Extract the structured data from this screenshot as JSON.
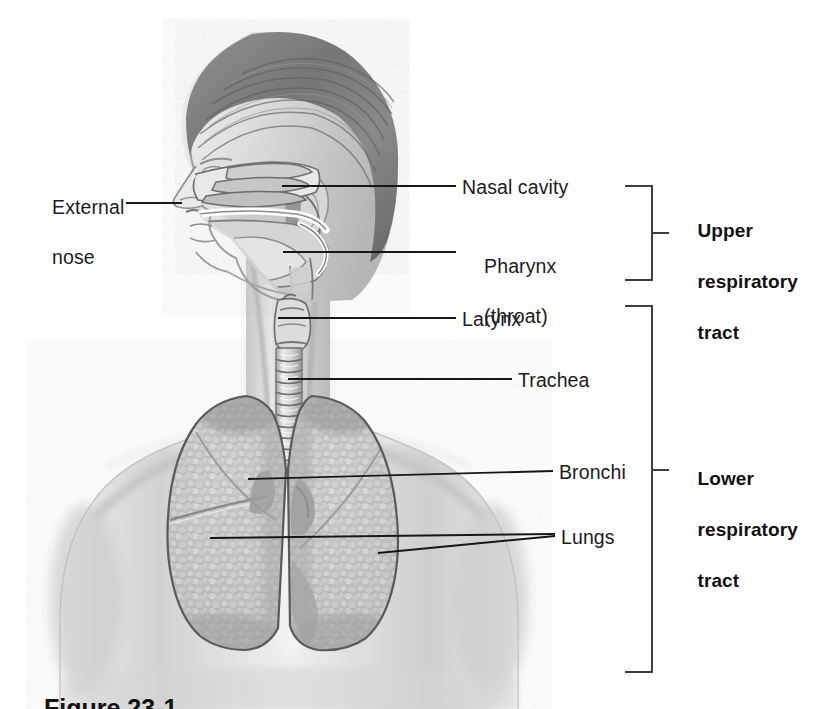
{
  "figure": {
    "background_color": "#ffffff",
    "line_color": "#14181c",
    "bracket_color": "#3b3f44",
    "text_color": "#1c1c1c",
    "width": 822,
    "height": 709
  },
  "labels": {
    "external_nose_line1": "External",
    "external_nose_line2": "nose",
    "nasal_cavity": "Nasal cavity",
    "pharynx_line1": "Pharynx",
    "pharynx_line2": "(throat)",
    "larynx": "Larynx",
    "trachea": "Trachea",
    "bronchi": "Bronchi",
    "lungs": "Lungs"
  },
  "brackets": {
    "upper_line1": "Upper",
    "upper_line2": "respiratory",
    "upper_line3": "tract",
    "lower_line1": "Lower",
    "lower_line2": "respiratory",
    "lower_line3": "tract"
  },
  "caption": {
    "text": "Figure 23-1"
  },
  "anatomy": {
    "parts": [
      "head-profile",
      "nasal-cavity",
      "oral-cavity",
      "pharynx",
      "larynx",
      "trachea",
      "right-lung",
      "left-lung",
      "bronchi",
      "torso"
    ]
  }
}
